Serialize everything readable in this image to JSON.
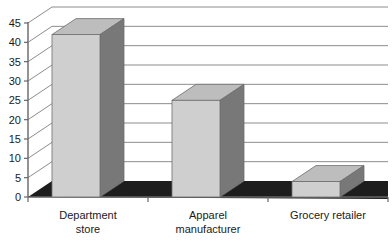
{
  "chart_data": {
    "type": "bar",
    "title": "",
    "subtitle": "",
    "xlabel": "",
    "ylabel": "",
    "categories": [
      "Department store",
      "Apparel manufacturer",
      "Grocery retailer"
    ],
    "category_lines": [
      [
        "Department",
        "store"
      ],
      [
        "Apparel",
        "manufacturer"
      ],
      [
        "Grocery retailer"
      ]
    ],
    "values": [
      42,
      25,
      4
    ],
    "ylim": [
      0,
      45
    ],
    "ytick_labels": [
      "0",
      "5",
      "10",
      "15",
      "20",
      "25",
      "30",
      "35",
      "40",
      "45"
    ],
    "ytick_values": [
      0,
      5,
      10,
      15,
      20,
      25,
      30,
      35,
      40,
      45
    ],
    "grid": true,
    "legend": false,
    "legend_position": "none",
    "three_d": true,
    "style": {
      "bar_front_color": "#cfcfcf",
      "bar_side_color": "#787878",
      "bar_top_color": "#bdbdbd",
      "bar_outline_color": "#6e6e6e",
      "floor_color": "#1d1d1d",
      "gridline_color": "#8c8c8c",
      "axis_color": "#666666",
      "text_color": "#1a1a1a",
      "background_color": "#ffffff"
    }
  }
}
